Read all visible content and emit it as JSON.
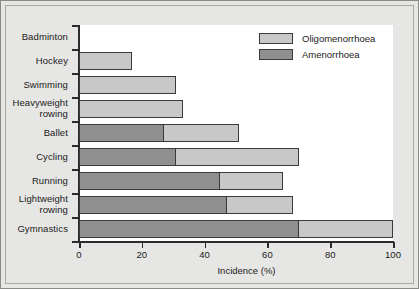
{
  "chart_data": {
    "type": "bar",
    "orientation": "horizontal",
    "stacked": true,
    "title": "",
    "xlabel": "Incidence (%)",
    "ylabel": "",
    "xlim": [
      0,
      100
    ],
    "xticks": [
      0,
      20,
      40,
      60,
      80,
      100
    ],
    "grid": false,
    "legend_position": "top-right",
    "categories": [
      "Badminton",
      "Hockey",
      "Swimming",
      "Heavyweight rowing",
      "Ballet",
      "Cycling",
      "Running",
      "Lightweight rowing",
      "Gymnastics"
    ],
    "series": [
      {
        "name": "Amenorrhoea",
        "color": "#8f8f8f",
        "values": [
          0,
          0,
          0,
          0,
          27,
          31,
          45,
          47,
          70
        ]
      },
      {
        "name": "Oligomenorrhoea",
        "color": "#c8c8c8",
        "values": [
          0,
          17,
          31,
          33,
          24,
          39,
          20,
          21,
          30
        ]
      }
    ],
    "totals": [
      0,
      17,
      31,
      33,
      51,
      70,
      65,
      68,
      100
    ]
  },
  "legend": {
    "items": [
      {
        "label": "Oligomenorrhoea",
        "color": "#c8c8c8"
      },
      {
        "label": "Amenorrhoea",
        "color": "#8f8f8f"
      }
    ]
  },
  "axis": {
    "x_title": "Incidence (%)",
    "x_tick_labels": [
      "0",
      "20",
      "40",
      "60",
      "80",
      "100"
    ]
  },
  "y_labels": [
    {
      "text": "Badminton",
      "line1": "Badminton",
      "line2": ""
    },
    {
      "text": "Hockey",
      "line1": "Hockey",
      "line2": ""
    },
    {
      "text": "Swimming",
      "line1": "Swimming",
      "line2": ""
    },
    {
      "text": "Heavyweight rowing",
      "line1": "Heavyweight",
      "line2": "rowing"
    },
    {
      "text": "Ballet",
      "line1": "Ballet",
      "line2": ""
    },
    {
      "text": "Cycling",
      "line1": "Cycling",
      "line2": ""
    },
    {
      "text": "Running",
      "line1": "Running",
      "line2": ""
    },
    {
      "text": "Lightweight rowing",
      "line1": "Lightweight",
      "line2": "rowing"
    },
    {
      "text": "Gymnastics",
      "line1": "Gymnastics",
      "line2": ""
    }
  ],
  "colors": {
    "amenorrhoea": "#8f8f8f",
    "oligomenorrhoea": "#c8c8c8",
    "plot_background": "#ffffff",
    "figure_background": "#e6e6e4",
    "axis": "#2b2b2b"
  }
}
